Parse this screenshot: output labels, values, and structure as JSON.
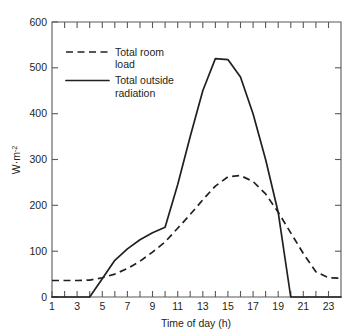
{
  "chart_data": {
    "type": "line",
    "title": "",
    "xlabel": "Time of day (h)",
    "ylabel": "W·m",
    "ylabel_exponent": "-2",
    "xlim": [
      1,
      24
    ],
    "ylim": [
      0,
      600
    ],
    "grid": false,
    "legend_position": "top-left",
    "x_ticks": [
      1,
      3,
      5,
      7,
      9,
      11,
      13,
      15,
      17,
      19,
      21,
      23
    ],
    "x_tick_labels": [
      "1",
      "3",
      "5",
      "7",
      "9",
      "11",
      "13",
      "15",
      "17",
      "19",
      "21",
      "23"
    ],
    "x_minor_ticks": [
      2,
      4,
      6,
      8,
      10,
      12,
      14,
      16,
      18,
      20,
      22,
      24
    ],
    "y_ticks": [
      0,
      100,
      200,
      300,
      400,
      500,
      600
    ],
    "y_tick_labels": [
      "0",
      "100",
      "200",
      "300",
      "400",
      "500",
      "600"
    ],
    "x": [
      1,
      2,
      3,
      4,
      5,
      6,
      7,
      8,
      9,
      10,
      11,
      12,
      13,
      14,
      15,
      16,
      17,
      18,
      19,
      20,
      21,
      22,
      23,
      24
    ],
    "series": [
      {
        "name": "Total room load",
        "style": "dashed",
        "color": "#231f20",
        "values": [
          36,
          36,
          36,
          37,
          42,
          50,
          62,
          78,
          98,
          120,
          150,
          180,
          212,
          242,
          262,
          265,
          252,
          225,
          185,
          140,
          95,
          55,
          42,
          41
        ]
      },
      {
        "name": "Total outside radiation",
        "style": "solid",
        "color": "#231f20",
        "values": [
          0,
          0,
          0,
          0,
          40,
          80,
          105,
          125,
          140,
          152,
          245,
          350,
          450,
          520,
          518,
          480,
          400,
          300,
          185,
          0,
          0,
          0,
          0,
          0
        ]
      }
    ],
    "legend": [
      {
        "label_line1": "Total room",
        "label_line2": "load",
        "style": "dashed"
      },
      {
        "label_line1": "Total outside",
        "label_line2": "radiation",
        "style": "solid"
      }
    ]
  }
}
